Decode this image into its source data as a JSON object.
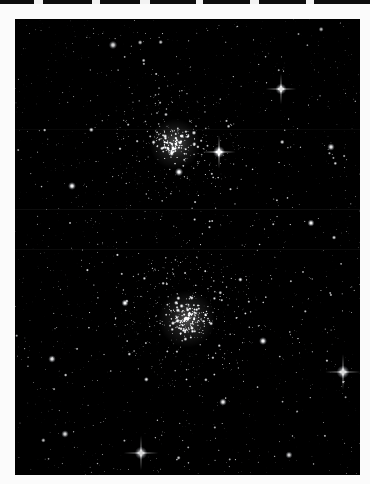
{
  "plate": {
    "width": 370,
    "height": 484,
    "title": "Double Cluster star field photographic plate",
    "background_color": "#ffffff",
    "paper_color": "#fbfbfb",
    "top_strip_color": "#0d0d0d",
    "sky_color": "#000000",
    "star_color": "#ffffff"
  },
  "frame": {
    "x": 15,
    "y": 15,
    "width": 345,
    "height": 456,
    "border_color": "#000000",
    "label": "sky-image-frame"
  },
  "top_strip": {
    "height": 4,
    "nicks": [
      {
        "x": 34,
        "width": 9
      },
      {
        "x": 92,
        "width": 8
      },
      {
        "x": 140,
        "width": 10
      },
      {
        "x": 196,
        "width": 7
      },
      {
        "x": 250,
        "width": 9
      },
      {
        "x": 306,
        "width": 8
      }
    ]
  },
  "chart_data": {
    "type": "scatter",
    "title": "Double Cluster (NGC 869 / NGC 884) in Perseus",
    "xlabel": "",
    "ylabel": "",
    "xlim": [
      0,
      345
    ],
    "ylim": [
      0,
      456
    ],
    "grid": false,
    "legend": "none",
    "background": "#000000",
    "point_color": "#ffffff",
    "note": "Monochrome wide-field star field; pixel coordinates are relative to the sky frame.",
    "clusters": [
      {
        "name": "NGC 869",
        "common_name": "upper cluster",
        "cx": 160,
        "cy": 125,
        "core_radius": 16,
        "halo_radius": 62,
        "core_star_count": 120,
        "halo_star_count": 230,
        "peak_brightness": 1.0
      },
      {
        "name": "NGC 884",
        "common_name": "lower cluster",
        "cx": 172,
        "cy": 300,
        "core_radius": 18,
        "halo_radius": 70,
        "core_star_count": 165,
        "halo_star_count": 300,
        "peak_brightness": 1.0
      }
    ],
    "bright_stars": [
      {
        "id": "A",
        "x": 204,
        "y": 133,
        "radius": 3.2,
        "spikes": true,
        "magnitude_rank": 2
      },
      {
        "id": "B",
        "x": 266,
        "y": 70,
        "radius": 2.9,
        "spikes": true,
        "magnitude_rank": 3
      },
      {
        "id": "C",
        "x": 328,
        "y": 353,
        "radius": 3.4,
        "spikes": true,
        "magnitude_rank": 1
      },
      {
        "id": "D",
        "x": 126,
        "y": 434,
        "radius": 3.3,
        "spikes": true,
        "magnitude_rank": 1
      },
      {
        "id": "E",
        "x": 164,
        "y": 153,
        "radius": 2.2,
        "spikes": false,
        "magnitude_rank": 5
      },
      {
        "id": "F",
        "x": 57,
        "y": 167,
        "radius": 2.1,
        "spikes": false,
        "magnitude_rank": 5
      },
      {
        "id": "G",
        "x": 98,
        "y": 26,
        "radius": 2.2,
        "spikes": false,
        "magnitude_rank": 5
      },
      {
        "id": "H",
        "x": 316,
        "y": 128,
        "radius": 2.0,
        "spikes": false,
        "magnitude_rank": 6
      },
      {
        "id": "I",
        "x": 248,
        "y": 322,
        "radius": 2.1,
        "spikes": false,
        "magnitude_rank": 6
      },
      {
        "id": "J",
        "x": 37,
        "y": 340,
        "radius": 2.0,
        "spikes": false,
        "magnitude_rank": 6
      },
      {
        "id": "K",
        "x": 296,
        "y": 204,
        "radius": 1.9,
        "spikes": false,
        "magnitude_rank": 7
      },
      {
        "id": "L",
        "x": 208,
        "y": 383,
        "radius": 2.0,
        "spikes": false,
        "magnitude_rank": 7
      },
      {
        "id": "M",
        "x": 50,
        "y": 415,
        "radius": 2.0,
        "spikes": false,
        "magnitude_rank": 7
      },
      {
        "id": "N",
        "x": 274,
        "y": 436,
        "radius": 1.9,
        "spikes": false,
        "magnitude_rank": 7
      },
      {
        "id": "O",
        "x": 110,
        "y": 284,
        "radius": 1.9,
        "spikes": false,
        "magnitude_rank": 7
      }
    ],
    "field_star_count": 1650,
    "mosaic_seams": [
      {
        "orientation": "horizontal",
        "y": 190,
        "opacity": 0.055
      },
      {
        "orientation": "horizontal",
        "y": 230,
        "opacity": 0.045
      },
      {
        "orientation": "horizontal",
        "y": 110,
        "opacity": 0.035
      }
    ],
    "vignette": {
      "enabled": true,
      "corner_darkening": 0.35
    }
  }
}
